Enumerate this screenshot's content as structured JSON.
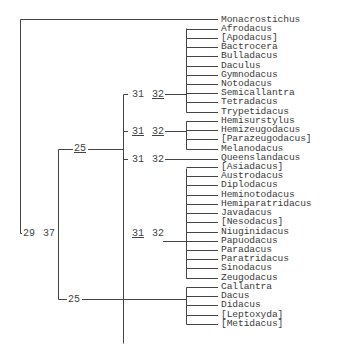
{
  "tree": {
    "taxa": [
      "Monacrostichus",
      "Afrodacus",
      "[Apodacus]",
      "Bactrocera",
      "Bulladacus",
      "Daculus",
      "Gymnodacus",
      "Notodacus",
      "Semicallantra",
      "Tetradacus",
      "Trypetidacus",
      "Hemisurstylus",
      "Hemizeugodacus",
      "[Parazeugodacus]",
      "Melanodacus",
      "Queenslandacus",
      "[Asiadacus]",
      "Austrodacus",
      "Diplodacus",
      "Heminotodacus",
      "Hemiparatridacus",
      "Javadacus",
      "[Nesodacus]",
      "Niuginidacus",
      "Papuodacus",
      "Paradacus",
      "Paratridacus",
      "Sinodacus",
      "Zeugodacus",
      "Callantra",
      "Dacus",
      "Didacus",
      "[Leptoxyda]",
      "[Metidacus]"
    ],
    "node_labels": {
      "root": {
        "a": "29",
        "b": "37"
      },
      "clade_bactrocera_group": {
        "a": "25"
      },
      "clade_dacus": {
        "a": "25"
      },
      "sub1": {
        "a": "31",
        "b": "32"
      },
      "sub2": {
        "a": "31",
        "b": "32"
      },
      "sub3": {
        "a": "31",
        "b": "32"
      },
      "sub4": {
        "a": "31",
        "b": "32"
      }
    },
    "colors": {
      "line": "#444444",
      "text": "#3a3a3a"
    }
  }
}
